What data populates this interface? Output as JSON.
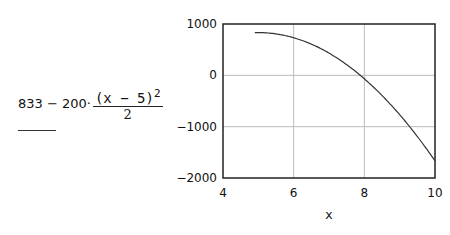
{
  "expression": {
    "prefix": "833 − 200·",
    "numerator": "(x − 5)",
    "exponent": "2",
    "denominator": "2"
  },
  "chart_data": {
    "type": "line",
    "title": "",
    "function": "833 - 200*(x-5)^2/2",
    "xlabel": "x",
    "ylabel": "833 - 200*(x-5)^2/2",
    "xlim": [
      4,
      10
    ],
    "ylim": [
      -2000,
      1000
    ],
    "x_ticks": [
      "4",
      "6",
      "8",
      "10"
    ],
    "y_ticks": [
      "1000",
      "0",
      "−1000",
      "−2000"
    ],
    "grid": true,
    "series": [
      {
        "name": "f(x)",
        "x": [
          4.9,
          5.0,
          5.5,
          6.0,
          6.5,
          7.0,
          7.5,
          8.0,
          8.5,
          9.0,
          9.5,
          10.0
        ],
        "values": [
          832,
          833,
          808,
          733,
          608,
          433,
          208,
          -67,
          -392,
          -767,
          -1192,
          -1667
        ]
      }
    ],
    "colors": {
      "line": "#333333",
      "grid": "#bbbbbb",
      "frame": "#222222"
    }
  }
}
